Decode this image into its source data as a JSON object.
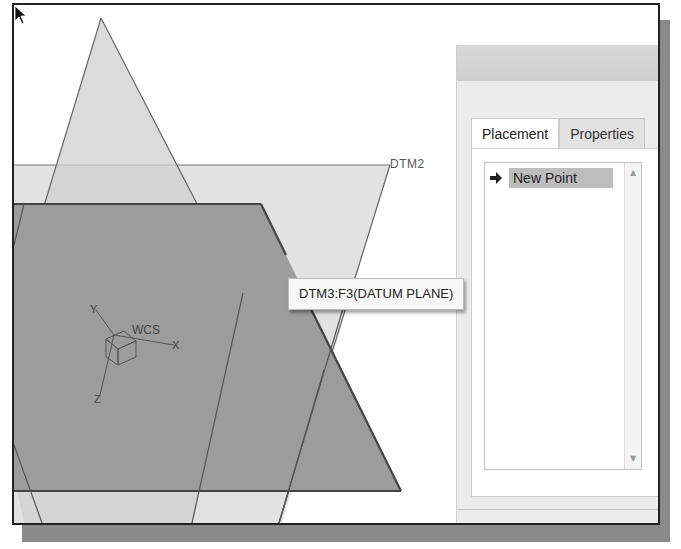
{
  "viewport": {
    "datum_planes": [
      {
        "name": "DTM1",
        "shape": "vertical-hexagon",
        "highlighted": false
      },
      {
        "name": "DTM2",
        "label": "DTM2",
        "shape": "horizontal-trapezoid",
        "highlighted": false
      },
      {
        "name": "DTM3",
        "shape": "highlighted-trapezoid",
        "highlighted": true
      }
    ],
    "dtm2_label": "DTM2",
    "csys": {
      "label": "WCS",
      "x_axis": "X",
      "y_axis": "Y",
      "z_axis": "Z"
    },
    "tooltip": "DTM3:F3(DATUM PLANE)",
    "colors": {
      "highlight_plane": "#9a9a9a",
      "light_plane": "#d9d9d9",
      "edge": "#444444"
    }
  },
  "dialog": {
    "tabs": [
      {
        "label": "Placement",
        "active": true
      },
      {
        "label": "Properties",
        "active": false
      }
    ],
    "list": {
      "items": [
        {
          "label": "New Point",
          "selected": true,
          "icon": "arrow-right-icon"
        }
      ]
    },
    "right_label_fragment": "R"
  }
}
